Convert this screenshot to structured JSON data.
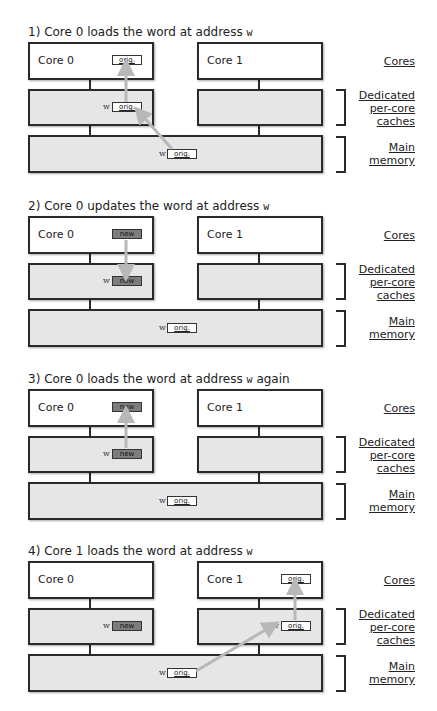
{
  "panels": [
    {
      "title": "1) Core 0 loads the word at address",
      "title_addr": "w",
      "title_suffix": "",
      "core0": {
        "label": "Core 0",
        "value": "orig.",
        "state": "orig"
      },
      "core1": {
        "label": "Core 1",
        "value": null
      },
      "cache0": {
        "addr": "w",
        "value": "orig.",
        "state": "orig"
      },
      "cache1": {
        "addr": null,
        "value": null
      },
      "memory": {
        "addr": "w",
        "value": "orig.",
        "state": "orig"
      },
      "arrows": [
        "memory-to-cache0",
        "cache0-to-core0"
      ]
    },
    {
      "title": "2) Core 0 updates the word at address",
      "title_addr": "w",
      "title_suffix": "",
      "core0": {
        "label": "Core 0",
        "value": "new",
        "state": "new"
      },
      "core1": {
        "label": "Core 1",
        "value": null
      },
      "cache0": {
        "addr": "w",
        "value": "new",
        "state": "new"
      },
      "cache1": {
        "addr": null,
        "value": null
      },
      "memory": {
        "addr": "w",
        "value": "orig.",
        "state": "orig"
      },
      "arrows": [
        "core0-to-cache0"
      ]
    },
    {
      "title": "3) Core 0 loads the word at address",
      "title_addr": "w",
      "title_suffix": " again",
      "core0": {
        "label": "Core 0",
        "value": "new",
        "state": "new"
      },
      "core1": {
        "label": "Core 1",
        "value": null
      },
      "cache0": {
        "addr": "w",
        "value": "new",
        "state": "new"
      },
      "cache1": {
        "addr": null,
        "value": null
      },
      "memory": {
        "addr": "w",
        "value": "orig.",
        "state": "orig"
      },
      "arrows": [
        "cache0-to-core0"
      ]
    },
    {
      "title": "4) Core 1 loads the word at address",
      "title_addr": "w",
      "title_suffix": "",
      "core0": {
        "label": "Core 0",
        "value": null
      },
      "core1": {
        "label": "Core 1",
        "value": "orig.",
        "state": "orig"
      },
      "cache0": {
        "addr": "w",
        "value": "new",
        "state": "new"
      },
      "cache1": {
        "addr": "w",
        "value": "orig.",
        "state": "orig"
      },
      "memory": {
        "addr": "w",
        "value": "orig.",
        "state": "orig"
      },
      "arrows": [
        "memory-to-cache1",
        "cache1-to-core1"
      ]
    }
  ],
  "legend": {
    "cores": "Cores",
    "caches_line1": "Dedicated",
    "caches_line2": "per-core",
    "caches_line3": "caches",
    "memory_line1": "Main",
    "memory_line2": "memory"
  },
  "colors": {
    "box_border": "#2a2a2a",
    "core_fill": "#ffffff",
    "cache_fill": "#e6e6e6",
    "new_value_fill": "#7d7d7d",
    "arrow": "#b8b8b8"
  }
}
